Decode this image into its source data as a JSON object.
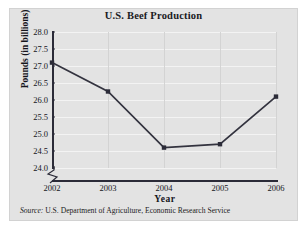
{
  "figure": {
    "title": "U.S. Beef Production",
    "source_lead": "Source:",
    "source_text": " U.S. Department of Agriculture, Economic Research Service",
    "panel_color": "#e3e3e3",
    "line_color": "#33333f",
    "marker_color": "#2b2b38",
    "gridline_color": "#f3f3f3"
  },
  "chart_data": {
    "type": "line",
    "title": "U.S. Beef Production",
    "xlabel": "Year",
    "ylabel": "Pounds (in billions)",
    "categories": [
      "2002",
      "2003",
      "2004",
      "2005",
      "2006"
    ],
    "x": [
      2002,
      2003,
      2004,
      2005,
      2006
    ],
    "values": [
      27.1,
      26.25,
      24.6,
      24.7,
      26.1
    ],
    "series": [
      {
        "name": "U.S. Beef Production",
        "values": [
          27.1,
          26.25,
          24.6,
          24.7,
          26.1
        ]
      }
    ],
    "ylim": [
      24.0,
      28.0
    ],
    "ytick_labels": [
      "28.0",
      "27.5",
      "27.0",
      "26.5",
      "26.0",
      "25.5",
      "25.0",
      "24.5",
      "24.0"
    ],
    "ytick_values": [
      28.0,
      27.5,
      27.0,
      26.5,
      26.0,
      25.5,
      25.0,
      24.5,
      24.0
    ],
    "xtick_labels": [
      "2002",
      "2003",
      "2004",
      "2005",
      "2006"
    ],
    "grid": true,
    "axis_break": true,
    "legend": "none",
    "marker": "square"
  }
}
